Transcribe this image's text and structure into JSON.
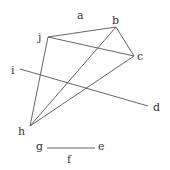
{
  "diagram": {
    "labels": [
      {
        "id": "a",
        "text": "a",
        "x": 77,
        "y": 19
      },
      {
        "id": "b",
        "text": "b",
        "x": 112,
        "y": 24
      },
      {
        "id": "j",
        "text": "j",
        "x": 38,
        "y": 41
      },
      {
        "id": "c",
        "text": "c",
        "x": 137,
        "y": 60
      },
      {
        "id": "i",
        "text": "i",
        "x": 11,
        "y": 74
      },
      {
        "id": "d",
        "text": "d",
        "x": 153,
        "y": 111
      },
      {
        "id": "h",
        "text": "h",
        "x": 18,
        "y": 135
      },
      {
        "id": "g",
        "text": "g",
        "x": 36,
        "y": 150
      },
      {
        "id": "e",
        "text": "e",
        "x": 98,
        "y": 150
      },
      {
        "id": "f",
        "text": "f",
        "x": 67,
        "y": 163
      }
    ],
    "points": {
      "b": [
        116,
        27
      ],
      "j": [
        48,
        37
      ],
      "c": [
        134,
        56
      ],
      "i": [
        20,
        69
      ],
      "d": [
        148,
        106
      ],
      "h": [
        30,
        126
      ],
      "g": [
        47,
        148
      ],
      "e": [
        95,
        148
      ]
    },
    "segments": [
      {
        "id": "j-b",
        "from": "j",
        "to": "b"
      },
      {
        "id": "j-c",
        "from": "j",
        "to": "c"
      },
      {
        "id": "b-c",
        "from": "b",
        "to": "c"
      },
      {
        "id": "j-h",
        "from": "j",
        "to": "h"
      },
      {
        "id": "h-b",
        "from": "h",
        "to": "b"
      },
      {
        "id": "h-c",
        "from": "h",
        "to": "c"
      },
      {
        "id": "i-d",
        "from": "i",
        "to": "d"
      },
      {
        "id": "g-e",
        "from": "g",
        "to": "e"
      }
    ],
    "line_color": "#555555",
    "text_color": "#333333"
  }
}
